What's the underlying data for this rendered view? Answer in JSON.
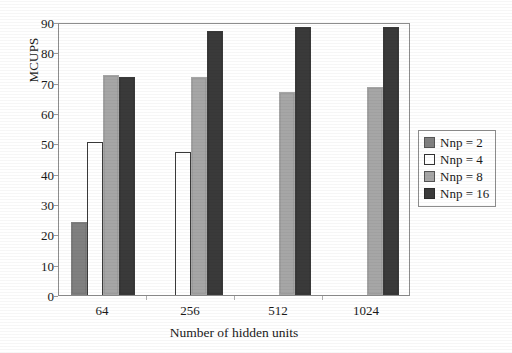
{
  "chart_data": {
    "type": "bar",
    "title": "",
    "xlabel": "Number of hidden units",
    "ylabel": "MCUPS",
    "categories": [
      "64",
      "256",
      "512",
      "1024"
    ],
    "ylim": [
      0,
      90
    ],
    "yticks": [
      0,
      10,
      20,
      30,
      40,
      50,
      60,
      70,
      80,
      90
    ],
    "grid": false,
    "legend_position": "right",
    "series": [
      {
        "name": "Nnp = 2",
        "color": "#808080",
        "values": [
          24,
          null,
          null,
          null
        ]
      },
      {
        "name": "Nnp = 4",
        "color": "#ffffff",
        "values": [
          50.5,
          47,
          null,
          null
        ]
      },
      {
        "name": "Nnp = 8",
        "color": "#a6a6a6",
        "values": [
          72.5,
          72,
          67,
          68.5
        ]
      },
      {
        "name": "Nnp = 16",
        "color": "#3a3a3a",
        "values": [
          72,
          87,
          88.5,
          88.5
        ]
      }
    ]
  },
  "axis": {
    "y_title": "MCUPS",
    "x_title": "Number of hidden units",
    "y_tick_labels": [
      "0",
      "10",
      "20",
      "30",
      "40",
      "50",
      "60",
      "70",
      "80",
      "90"
    ],
    "x_tick_labels": [
      "64",
      "256",
      "512",
      "1024"
    ]
  },
  "legend": {
    "items": [
      {
        "label": "Nnp = 2",
        "color": "#808080",
        "border": "#555555"
      },
      {
        "label": "Nnp = 4",
        "color": "#ffffff",
        "border": "#333333"
      },
      {
        "label": "Nnp = 8",
        "color": "#a6a6a6",
        "border": "#555555"
      },
      {
        "label": "Nnp = 16",
        "color": "#3a3a3a",
        "border": "#2a2a2a"
      }
    ]
  },
  "colors": {
    "frame": "#8d8d8d",
    "text": "#1a1a1a",
    "background": "#ffffff"
  }
}
